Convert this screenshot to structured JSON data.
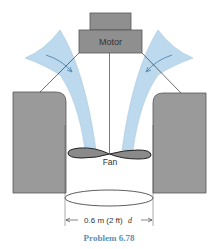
{
  "figure": {
    "caption": "Problem 6.78",
    "labels": {
      "motor": "Motor",
      "fan": "Fan",
      "dimension": "0.6 m (2 ft)",
      "dimension_symbol": "d"
    },
    "colors": {
      "block_fill": "#9a9a9a",
      "block_stroke": "#555555",
      "motor_fill": "#8f8f8f",
      "flow_fill": "#bcd9ee",
      "flow_stroke": "#7fa9c8",
      "caption": "#5b8fb5",
      "line": "#333333"
    }
  }
}
